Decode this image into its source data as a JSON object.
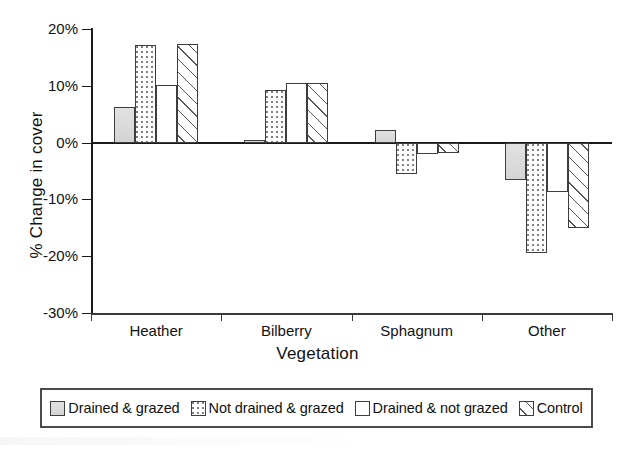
{
  "chart_data": {
    "type": "bar",
    "title": "",
    "xlabel": "Vegetation",
    "ylabel": "% Change in cover",
    "categories": [
      "Heather",
      "Bilberry",
      "Sphagnum",
      "Other"
    ],
    "ylim": [
      -30,
      20
    ],
    "ytick_values": [
      20,
      10,
      0,
      -10,
      -20,
      -30
    ],
    "ytick_labels": [
      "20%",
      "10%",
      "0%",
      "-10%",
      "-20%",
      "-30%"
    ],
    "grid": false,
    "legend_position": "bottom",
    "series": [
      {
        "name": "Drained & grazed",
        "pattern": "solid-gray",
        "values": [
          6.2,
          0.5,
          2.3,
          -6.5
        ]
      },
      {
        "name": "Not drained & grazed",
        "pattern": "dotted",
        "values": [
          17.2,
          9.3,
          -5.5,
          -19.5
        ]
      },
      {
        "name": "Drained & not grazed",
        "pattern": "white",
        "values": [
          10.2,
          10.5,
          -2.0,
          -8.7
        ]
      },
      {
        "name": "Control",
        "pattern": "diagonal-hatch",
        "values": [
          17.3,
          10.5,
          -1.9,
          -15.1
        ]
      }
    ]
  },
  "legend": {
    "items": [
      {
        "label": "Drained & grazed",
        "pattern": "solid-gray"
      },
      {
        "label": "Not drained & grazed",
        "pattern": "dotted"
      },
      {
        "label": "Drained & not grazed",
        "pattern": "white"
      },
      {
        "label": "Control",
        "pattern": "diagonal-hatch"
      }
    ]
  },
  "colors": {
    "axis": "#1a1a1a",
    "bar_border": "#3d3d3d",
    "solid_fill": "#d2d2d2",
    "background": "#ffffff"
  }
}
